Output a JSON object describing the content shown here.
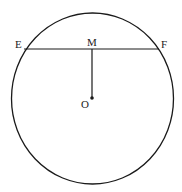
{
  "diagram": {
    "type": "circle-chord-perpendicular",
    "circle": {
      "cx": 92.5,
      "cy": 98.5,
      "rx": 81,
      "ry": 85.5,
      "stroke": "#1a1a1a"
    },
    "chord": {
      "x1": 24,
      "y1": 49,
      "x2": 159,
      "y2": 49
    },
    "segment": {
      "x1": 92,
      "y1": 49,
      "x2": 92,
      "y2": 98
    },
    "center_dot": {
      "cx": 92,
      "cy": 98,
      "r": 1.8
    },
    "labels": {
      "E": "E",
      "F": "F",
      "M": "M",
      "O": "O"
    }
  }
}
